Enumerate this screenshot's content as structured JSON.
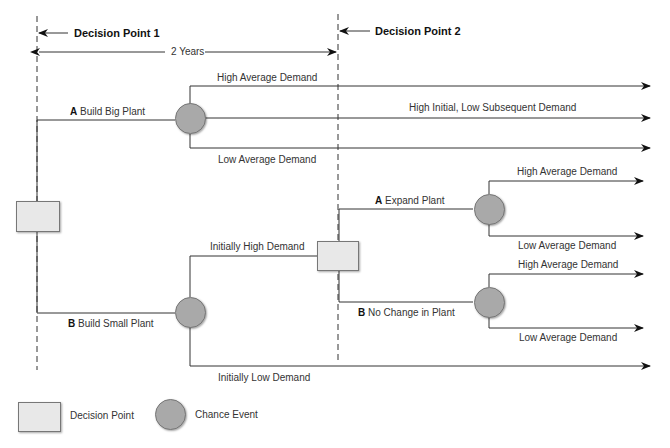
{
  "diagram": {
    "type": "decision-tree",
    "timeline": {
      "decision_point_1": "Decision Point 1",
      "decision_point_2": "Decision Point 2",
      "interval": "2 Years"
    },
    "branches": {
      "a_letter": "A",
      "a_label": "Build Big Plant",
      "b_letter": "B",
      "b_label": "Build Small Plant"
    },
    "big_plant_outcomes": {
      "high": "High Average Demand",
      "mixed": "High Initial, Low Subsequent Demand",
      "low": "Low Average Demand"
    },
    "small_plant_outcomes": {
      "initially_high": "Initially High Demand",
      "initially_low": "Initially Low Demand"
    },
    "second_decision": {
      "a_letter": "A",
      "a_label": "Expand Plant",
      "b_letter": "B",
      "b_label": "No Change in Plant"
    },
    "expand_outcomes": {
      "high": "High Average Demand",
      "low": "Low Average Demand"
    },
    "nochange_outcomes": {
      "high": "High Average Demand",
      "low": "Low Average Demand"
    },
    "legend": {
      "decision_point": "Decision Point",
      "chance_event": "Chance Event"
    },
    "colors": {
      "decision_fill": "#e8e8e8",
      "chance_fill": "#a9a9a9",
      "line": "#333333"
    }
  }
}
